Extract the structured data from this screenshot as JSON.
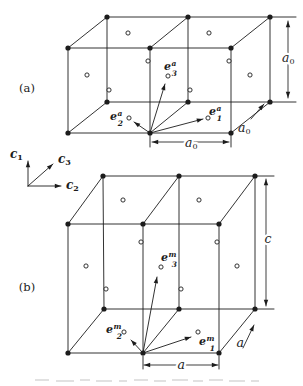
{
  "figure": {
    "background": "#ffffff",
    "ink": "#1c1c1c",
    "atom_open_fill": "#ffffff",
    "panels": [
      {
        "name": "panel-a",
        "label": {
          "text": "(a)",
          "x": 27,
          "y": 88
        },
        "edges": [
          [
            68,
            48,
            231,
            48
          ],
          [
            68,
            133,
            231,
            133
          ],
          [
            68,
            48,
            68,
            133
          ],
          [
            150,
            48,
            150,
            133
          ],
          [
            231,
            48,
            231,
            133
          ],
          [
            107,
            17,
            270,
            17
          ],
          [
            107,
            102,
            270,
            102
          ],
          [
            107,
            17,
            107,
            102
          ],
          [
            188,
            17,
            188,
            102
          ],
          [
            270,
            17,
            270,
            102
          ],
          [
            68,
            48,
            107,
            17
          ],
          [
            150,
            48,
            188,
            17
          ],
          [
            231,
            48,
            270,
            17
          ],
          [
            68,
            133,
            107,
            102
          ],
          [
            150,
            133,
            188,
            102
          ],
          [
            231,
            133,
            270,
            102
          ],
          [
            270,
            17,
            296,
            17
          ],
          [
            270,
            102,
            296,
            102
          ],
          [
            150,
            135,
            150,
            147
          ],
          [
            231,
            135,
            231,
            147
          ]
        ],
        "corner_atoms": [
          [
            68,
            48
          ],
          [
            150,
            48
          ],
          [
            231,
            48
          ],
          [
            68,
            133
          ],
          [
            150,
            133
          ],
          [
            231,
            133
          ],
          [
            107,
            17
          ],
          [
            188,
            17
          ],
          [
            270,
            17
          ],
          [
            107,
            102
          ],
          [
            188,
            102
          ],
          [
            270,
            102
          ]
        ],
        "face_atoms": [
          [
            128,
            33
          ],
          [
            209,
            33
          ],
          [
            148,
            61
          ],
          [
            229,
            61
          ],
          [
            87,
            75
          ],
          [
            250,
            75
          ],
          [
            168,
            76
          ],
          [
            109,
            90
          ],
          [
            190,
            90
          ],
          [
            129,
            118
          ],
          [
            208,
            118
          ]
        ],
        "vectors": [
          {
            "name": "basis-vector-e1-a",
            "base": "e",
            "sub": "1",
            "sup": "a",
            "x1": 150,
            "y1": 133,
            "x2": 203,
            "y2": 119,
            "lx": 215,
            "ly": 111
          },
          {
            "name": "basis-vector-e2-a",
            "base": "e",
            "sub": "2",
            "sup": "a",
            "x1": 150,
            "y1": 133,
            "x2": 134,
            "y2": 122,
            "lx": 116,
            "ly": 116
          },
          {
            "name": "basis-vector-e3-a",
            "base": "e",
            "sub": "3",
            "sup": "a",
            "x1": 150,
            "y1": 133,
            "x2": 165,
            "y2": 84,
            "lx": 170,
            "ly": 66
          }
        ],
        "dims": [
          {
            "name": "dimension-a0-height",
            "type": "double",
            "x1": 288,
            "y1": 21,
            "x2": 288,
            "y2": 98,
            "label": {
              "base": "a",
              "sub": "0",
              "x": 288,
              "y": 57,
              "halo": true
            }
          },
          {
            "name": "dimension-a0-width",
            "type": "double",
            "x1": 152,
            "y1": 142,
            "x2": 229,
            "y2": 142,
            "label": {
              "base": "a",
              "sub": "0",
              "x": 191,
              "y": 142,
              "halo": true
            }
          },
          {
            "name": "dimension-a0-depth",
            "type": "single",
            "x1": 251,
            "y1": 119,
            "x2": 264,
            "y2": 104,
            "label": {
              "base": "a",
              "sub": "0",
              "x": 244,
              "y": 127,
              "halo": false
            }
          }
        ]
      },
      {
        "name": "panel-b",
        "label": {
          "text": "(b)",
          "x": 27,
          "y": 287
        },
        "edges": [
          [
            68,
            224,
            219,
            224
          ],
          [
            68,
            353,
            219,
            353
          ],
          [
            68,
            224,
            68,
            353
          ],
          [
            143,
            224,
            143,
            353
          ],
          [
            219,
            224,
            219,
            353
          ],
          [
            103,
            176,
            255,
            176
          ],
          [
            104,
            309,
            255,
            309
          ],
          [
            103,
            176,
            104,
            309
          ],
          [
            179,
            176,
            179,
            309
          ],
          [
            255,
            176,
            255,
            309
          ],
          [
            68,
            224,
            103,
            176
          ],
          [
            143,
            224,
            179,
            176
          ],
          [
            219,
            224,
            255,
            176
          ],
          [
            68,
            353,
            104,
            309
          ],
          [
            143,
            353,
            179,
            309
          ],
          [
            219,
            353,
            255,
            309
          ],
          [
            255,
            176,
            274,
            176
          ],
          [
            255,
            309,
            274,
            309
          ],
          [
            143,
            356,
            143,
            369
          ],
          [
            219,
            356,
            219,
            369
          ]
        ],
        "corner_atoms": [
          [
            68,
            224
          ],
          [
            143,
            224
          ],
          [
            219,
            224
          ],
          [
            68,
            353
          ],
          [
            143,
            353
          ],
          [
            219,
            353
          ],
          [
            103,
            176
          ],
          [
            179,
            176
          ],
          [
            255,
            176
          ],
          [
            104,
            309
          ],
          [
            179,
            309
          ],
          [
            255,
            309
          ]
        ],
        "face_atoms": [
          [
            123,
            200
          ],
          [
            199,
            200
          ],
          [
            141,
            242
          ],
          [
            217,
            242
          ],
          [
            86,
            266
          ],
          [
            237,
            266
          ],
          [
            161,
            267
          ],
          [
            106,
            289
          ],
          [
            181,
            289
          ],
          [
            124,
            332
          ],
          [
            198,
            332
          ]
        ],
        "vectors": [
          {
            "name": "basis-vector-e1-m",
            "base": "e",
            "sub": "1",
            "sup": "m",
            "x1": 143,
            "y1": 353,
            "x2": 191,
            "y2": 337,
            "lx": 205,
            "ly": 341
          },
          {
            "name": "basis-vector-e2-m",
            "base": "e",
            "sub": "2",
            "sup": "m",
            "x1": 143,
            "y1": 353,
            "x2": 131,
            "y2": 340,
            "lx": 112,
            "ly": 329
          },
          {
            "name": "basis-vector-e3-m",
            "base": "e",
            "sub": "3",
            "sup": "m",
            "x1": 143,
            "y1": 353,
            "x2": 157,
            "y2": 277,
            "lx": 167,
            "ly": 257
          }
        ],
        "dims": [
          {
            "name": "dimension-c-height",
            "type": "double",
            "x1": 266,
            "y1": 179,
            "x2": 266,
            "y2": 306,
            "label": {
              "base": "c",
              "sub": "",
              "x": 268,
              "y": 238,
              "halo": true
            }
          },
          {
            "name": "dimension-a-width",
            "type": "double",
            "x1": 144,
            "y1": 365,
            "x2": 218,
            "y2": 365,
            "label": {
              "base": "a",
              "sub": "",
              "x": 181,
              "y": 364,
              "halo": true
            }
          },
          {
            "name": "dimension-a-depth",
            "type": "single",
            "x1": 243,
            "y1": 348,
            "x2": 254,
            "y2": 325,
            "label": {
              "base": "a",
              "sub": "",
              "x": 240,
              "y": 342,
              "halo": false
            }
          }
        ]
      }
    ],
    "axes": {
      "name": "crystal-axes",
      "origin": [
        28,
        186
      ],
      "arrows": [
        {
          "name": "axis-c1",
          "x2": 28,
          "y2": 161,
          "label": {
            "base": "c",
            "sub": "1",
            "x": 16,
            "y": 153
          }
        },
        {
          "name": "axis-c2",
          "x2": 61,
          "y2": 186,
          "label": {
            "base": "c",
            "sub": "2",
            "x": 72,
            "y": 184
          }
        },
        {
          "name": "axis-c3",
          "x2": 53,
          "y2": 164,
          "label": {
            "base": "c",
            "sub": "3",
            "x": 64,
            "y": 158
          }
        }
      ]
    },
    "caption_marks": [
      [
        35,
        379,
        14
      ],
      [
        56,
        380,
        18
      ],
      [
        80,
        379,
        10
      ],
      [
        96,
        380,
        16
      ],
      [
        119,
        380,
        8
      ],
      [
        134,
        379,
        14
      ],
      [
        154,
        380,
        12
      ],
      [
        172,
        379,
        16
      ],
      [
        193,
        380,
        10
      ],
      [
        209,
        379,
        14
      ],
      [
        229,
        380,
        16
      ],
      [
        251,
        380,
        8
      ]
    ]
  }
}
